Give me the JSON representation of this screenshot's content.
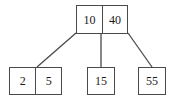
{
  "diagram": {
    "type": "b-tree",
    "stroke_color": "#4a4a4a",
    "text_color": "#1a1a1a",
    "background_color": "#ffffff",
    "nodes": [
      {
        "id": "root",
        "role": "root",
        "keys": [
          "10",
          "40"
        ]
      },
      {
        "id": "leaf-left",
        "role": "leaf",
        "keys": [
          "2",
          "5"
        ]
      },
      {
        "id": "leaf-middle",
        "role": "leaf",
        "keys": [
          "15"
        ]
      },
      {
        "id": "leaf-right",
        "role": "leaf",
        "keys": [
          "55"
        ]
      }
    ],
    "edges": [
      {
        "from": "root",
        "to": "leaf-left",
        "x1": 76,
        "y1": 33,
        "x2": 37,
        "y2": 67
      },
      {
        "from": "root",
        "to": "leaf-middle",
        "x1": 101,
        "y1": 33,
        "x2": 101,
        "y2": 67
      },
      {
        "from": "root",
        "to": "leaf-right",
        "x1": 128,
        "y1": 33,
        "x2": 152,
        "y2": 67
      }
    ]
  }
}
